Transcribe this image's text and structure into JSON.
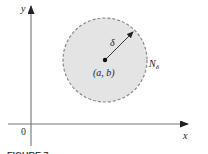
{
  "figure": {
    "type": "neighborhood-disk",
    "colors": {
      "disk_fill": "#e4e4e4",
      "disk_border": "#8a8a8a",
      "axis": "#666666",
      "text": "#222222",
      "background": "#ffffff"
    },
    "axes": {
      "x_label": "x",
      "y_label": "y",
      "origin_label": "0"
    },
    "disk": {
      "center_label": "(a, b)",
      "radius_label": "δ",
      "name_label": "N",
      "name_subscript": "δ",
      "border_style": "dashed"
    },
    "caption_fragment": "FIGURE 7"
  }
}
